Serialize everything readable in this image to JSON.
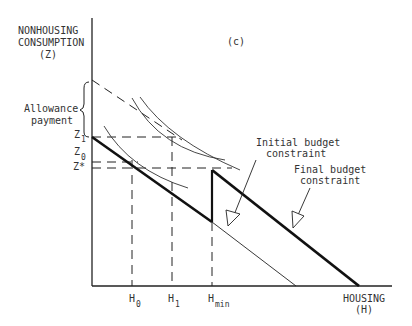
{
  "figure": {
    "panel_label": "(c)",
    "y_axis": {
      "line1": "NONHOUSING",
      "line2": "CONSUMPTION",
      "line3": "(Z)"
    },
    "x_axis": {
      "line1": "HOUSING",
      "line2": "(H)"
    },
    "y_ticks": [
      {
        "base": "Z",
        "sub": "1"
      },
      {
        "base": "Z",
        "sub": "0"
      },
      {
        "base": "Z*",
        "sub": ""
      }
    ],
    "x_ticks": [
      {
        "base": "H",
        "sub": "0"
      },
      {
        "base": "H",
        "sub": "1"
      },
      {
        "base": "H",
        "sub": "min"
      }
    ],
    "brace_label": {
      "line1": "Allowance",
      "line2": "payment"
    },
    "annotations": {
      "initial": {
        "line1": "Initial budget",
        "line2": "constraint"
      },
      "final": {
        "line1": "Final budget",
        "line2": "constraint"
      }
    },
    "colors": {
      "ink": "#1a1a1a",
      "background": "#ffffff"
    }
  }
}
